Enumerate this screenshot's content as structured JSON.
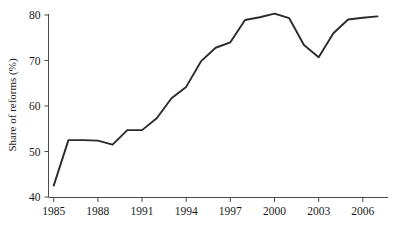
{
  "chart_data": {
    "type": "line",
    "title": "",
    "subtitle": "",
    "xlabel": "",
    "ylabel": "Share of reforms (%)",
    "xlim": [
      1985,
      2007
    ],
    "ylim": [
      40,
      80
    ],
    "grid": false,
    "legend": null,
    "x_ticks": [
      "1985",
      "1988",
      "1991",
      "1994",
      "1997",
      "2000",
      "2003",
      "2006"
    ],
    "x_tick_values": [
      1985,
      1988,
      1991,
      1994,
      1997,
      2000,
      2003,
      2006
    ],
    "y_ticks": [
      "40",
      "50",
      "60",
      "70",
      "80"
    ],
    "y_tick_values": [
      40,
      50,
      60,
      70,
      80
    ],
    "line_color": "#2b2b2b",
    "axis_color": "#4a4a4a",
    "background": "#ffffff",
    "series": [
      {
        "name": "Share of reforms",
        "x": [
          1985,
          1986,
          1987,
          1988,
          1989,
          1990,
          1991,
          1992,
          1993,
          1994,
          1995,
          1996,
          1997,
          1998,
          1999,
          2000,
          2001,
          2002,
          2003,
          2004,
          2005,
          2006,
          2007
        ],
        "values": [
          42.5,
          52.5,
          52.5,
          52.4,
          51.5,
          54.7,
          54.7,
          57.3,
          61.7,
          64.2,
          69.8,
          72.8,
          74.0,
          78.9,
          79.5,
          80.3,
          79.3,
          73.4,
          70.7,
          76.0,
          79.0,
          79.4,
          79.7
        ]
      }
    ]
  },
  "axes": {
    "y_axis_label": "Share of reforms (%)"
  }
}
